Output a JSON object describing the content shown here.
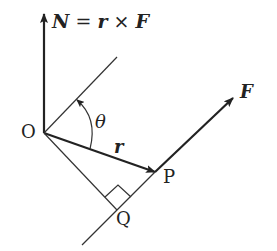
{
  "diagram": {
    "title_equation": {
      "lhs": "N",
      "eq": "=",
      "r": "r",
      "cross": "×",
      "F": "F"
    },
    "labels": {
      "origin": "O",
      "angle": "θ",
      "position_vector": "r",
      "point_p": "P",
      "point_q": "Q",
      "force": "F"
    },
    "colors": {
      "line": "#222222",
      "background": "#ffffff"
    }
  }
}
